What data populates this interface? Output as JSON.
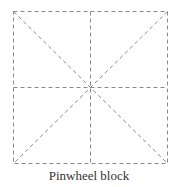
{
  "caption": "Pinwheel block",
  "diagram": {
    "stroke_color": "#8a8a8a",
    "dash": "4,3",
    "square": {
      "x1": 13,
      "y1": 11,
      "x2": 168,
      "y2": 164
    },
    "lines": [
      "outer-square",
      "vertical-midline",
      "horizontal-midline",
      "diagonal-tl-br",
      "diagonal-tr-bl"
    ]
  }
}
